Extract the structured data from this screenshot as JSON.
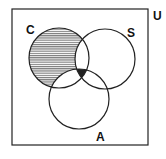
{
  "diagram": {
    "type": "venn",
    "universe_label": "U",
    "sets": [
      {
        "label": "C",
        "cx": 59,
        "cy": 58,
        "r": 30
      },
      {
        "label": "S",
        "cx": 105,
        "cy": 59,
        "r": 30
      },
      {
        "label": "A",
        "cx": 79,
        "cy": 99,
        "r": 30
      }
    ],
    "shaded_regions": [
      {
        "region": "C only (C minus S and A)",
        "style": "horizontal hatching"
      },
      {
        "region": "C ∩ S ∩ A",
        "style": "solid dark"
      }
    ],
    "colors": {
      "stroke": "#222222",
      "hatch": "#555555",
      "fill": "#ffffff"
    }
  }
}
